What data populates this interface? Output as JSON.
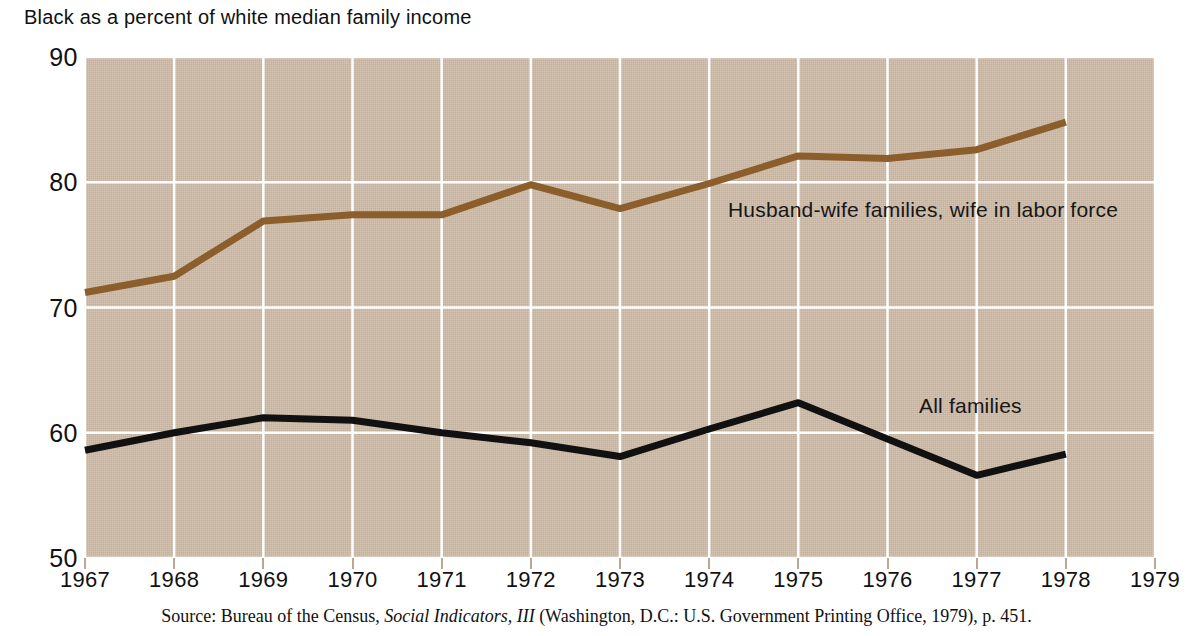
{
  "chart_data": {
    "type": "line",
    "title": "Black as a percent of white median family income",
    "xlabel": "",
    "ylabel": "",
    "x": [
      1967,
      1968,
      1969,
      1970,
      1971,
      1972,
      1973,
      1974,
      1975,
      1976,
      1977,
      1978
    ],
    "xlim": [
      1967,
      1979
    ],
    "ylim": [
      50,
      90
    ],
    "xticks": [
      "1967",
      "1968",
      "1969",
      "1970",
      "1971",
      "1972",
      "1973",
      "1974",
      "1975",
      "1976",
      "1977",
      "1978",
      "1979"
    ],
    "yticks": [
      "90",
      "80",
      "70",
      "60",
      "50"
    ],
    "grid": true,
    "legend_position": "inline-annotation",
    "plot_background_color": "#cbbaa7",
    "gridline_color": "#ffffff",
    "series": [
      {
        "name": "Husband-wife families, wife in labor force",
        "color": "#8b5e2b",
        "values": [
          71.2,
          72.5,
          76.9,
          77.4,
          77.4,
          79.8,
          77.9,
          79.9,
          82.1,
          81.9,
          82.6,
          84.8
        ]
      },
      {
        "name": "All families",
        "color": "#111111",
        "values": [
          58.6,
          60.0,
          61.2,
          61.0,
          60.0,
          59.2,
          58.1,
          60.3,
          62.4,
          59.5,
          56.6,
          58.3
        ]
      }
    ]
  },
  "annotations": {
    "husband_wife_label": "Husband-wife families, wife in labor force",
    "all_families_label": "All families"
  },
  "source": {
    "prefix": "Source: Bureau of the Census, ",
    "italic": "Social Indicators, III",
    "suffix": " (Washington, D.C.: U.S. Government Printing Office, 1979), p. 451."
  }
}
